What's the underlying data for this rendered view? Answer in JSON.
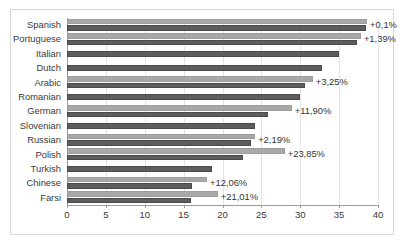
{
  "chart_data": {
    "type": "bar",
    "orientation": "horizontal",
    "title": "",
    "xlabel": "",
    "ylabel": "",
    "xlim": [
      0,
      40
    ],
    "xticks": [
      0,
      5,
      10,
      15,
      20,
      25,
      30,
      35,
      40
    ],
    "grid": true,
    "legend": null,
    "categories": [
      "Spanish",
      "Portuguese",
      "Italian",
      "Dutch",
      "Arabic",
      "Romanian",
      "German",
      "Slovenian",
      "Russian",
      "Polish",
      "Turkish",
      "Chinese",
      "Farsi"
    ],
    "series": [
      {
        "name": "upper-bar",
        "color": "#a8a8a8",
        "values": [
          38.6,
          37.8,
          35.0,
          32.8,
          31.6,
          30.0,
          28.9,
          24.2,
          24.2,
          28.0,
          18.7,
          18.0,
          19.4
        ]
      },
      {
        "name": "lower-bar",
        "color": "#5d5d5d",
        "values": [
          38.5,
          37.3,
          35.0,
          32.8,
          30.6,
          30.0,
          25.8,
          24.2,
          23.7,
          22.6,
          18.7,
          16.1,
          16.0
        ]
      }
    ],
    "annotations": [
      {
        "category": "Spanish",
        "label": "+0,1%"
      },
      {
        "category": "Portuguese",
        "label": "+1,39%"
      },
      {
        "category": "Italian",
        "label": ""
      },
      {
        "category": "Dutch",
        "label": ""
      },
      {
        "category": "Arabic",
        "label": "+3,25%"
      },
      {
        "category": "Romanian",
        "label": ""
      },
      {
        "category": "German",
        "label": "+11,90%"
      },
      {
        "category": "Slovenian",
        "label": ""
      },
      {
        "category": "Russian",
        "label": "+2,19%"
      },
      {
        "category": "Polish",
        "label": "+23,85%"
      },
      {
        "category": "Turkish",
        "label": ""
      },
      {
        "category": "Chinese",
        "label": "+12,06%"
      },
      {
        "category": "Farsi",
        "label": "+21,01%"
      }
    ]
  }
}
